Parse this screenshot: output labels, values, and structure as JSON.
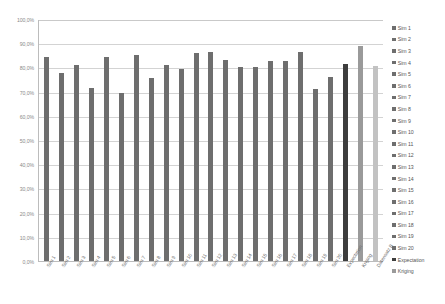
{
  "chart_data": {
    "type": "bar",
    "title": "",
    "xlabel": "",
    "ylabel": "",
    "ylim": [
      0,
      100
    ],
    "ytick_labels": [
      "100,0%",
      "90,0%",
      "80,0%",
      "70,0%",
      "60,0%",
      "50,0%",
      "40,0%",
      "30,0%",
      "20,0%",
      "10,0%",
      "0,0%"
    ],
    "ytick_values": [
      100,
      90,
      80,
      70,
      60,
      50,
      40,
      30,
      20,
      10,
      0
    ],
    "grid": true,
    "legend_position": "right",
    "categories": [
      "Sim 1",
      "Sim 2",
      "Sim 3",
      "Sim 4",
      "Sim 5",
      "Sim 6",
      "Sim 7",
      "Sim 8",
      "Sim 9",
      "Sim 10",
      "Sim 11",
      "Sim 12",
      "Sim 13",
      "Sim 14",
      "Sim 15",
      "Sim 16",
      "Sim 17",
      "Sim 18",
      "Sim 19",
      "Sim 20",
      "Expectation",
      "Kriging",
      "Datensatz B"
    ],
    "values": [
      84.5,
      77.5,
      81.0,
      71.5,
      84.5,
      69.5,
      85.0,
      75.5,
      81.0,
      79.5,
      86.0,
      86.5,
      83.0,
      80.0,
      80.0,
      82.5,
      82.5,
      86.5,
      71.0,
      76.0,
      81.5,
      89.0,
      80.5
    ],
    "bar_colors": [
      "#6e6e6e",
      "#6e6e6e",
      "#6e6e6e",
      "#6e6e6e",
      "#6e6e6e",
      "#6e6e6e",
      "#6e6e6e",
      "#6e6e6e",
      "#6e6e6e",
      "#6e6e6e",
      "#6e6e6e",
      "#6e6e6e",
      "#6e6e6e",
      "#6e6e6e",
      "#6e6e6e",
      "#6e6e6e",
      "#6e6e6e",
      "#6e6e6e",
      "#6e6e6e",
      "#6e6e6e",
      "#3d3d3d",
      "#9a9a9a",
      "#c2c2c2"
    ]
  },
  "legend": {
    "items": [
      {
        "label": "Sim 1",
        "color": "#6e6e6e"
      },
      {
        "label": "Sim 2",
        "color": "#6e6e6e"
      },
      {
        "label": "Sim 3",
        "color": "#6e6e6e"
      },
      {
        "label": "Sim 4",
        "color": "#6e6e6e"
      },
      {
        "label": "Sim 5",
        "color": "#6e6e6e"
      },
      {
        "label": "Sim 6",
        "color": "#6e6e6e"
      },
      {
        "label": "Sim 7",
        "color": "#6e6e6e"
      },
      {
        "label": "Sim 8",
        "color": "#6e6e6e"
      },
      {
        "label": "Sim 9",
        "color": "#6e6e6e"
      },
      {
        "label": "Sim 10",
        "color": "#6e6e6e"
      },
      {
        "label": "Sim 11",
        "color": "#6e6e6e"
      },
      {
        "label": "Sim 12",
        "color": "#6e6e6e"
      },
      {
        "label": "Sim 13",
        "color": "#6e6e6e"
      },
      {
        "label": "Sim 14",
        "color": "#6e6e6e"
      },
      {
        "label": "Sim 15",
        "color": "#6e6e6e"
      },
      {
        "label": "Sim 16",
        "color": "#6e6e6e"
      },
      {
        "label": "Sim 17",
        "color": "#6e6e6e"
      },
      {
        "label": "Sim 18",
        "color": "#6e6e6e"
      },
      {
        "label": "Sim 19",
        "color": "#6e6e6e"
      },
      {
        "label": "Sim 20",
        "color": "#6e6e6e"
      },
      {
        "label": "Expectation",
        "color": "#3d3d3d"
      },
      {
        "label": "Kriging",
        "color": "#9a9a9a"
      }
    ]
  },
  "colors": {
    "bar_default": "#6e6e6e",
    "bar_expectation": "#3d3d3d",
    "bar_kriging": "#9a9a9a",
    "bar_datensatz_b": "#c2c2c2",
    "gridline": "#d3d3d3",
    "axis": "#bcbcbc",
    "tick_text": "#8a8a8a"
  }
}
